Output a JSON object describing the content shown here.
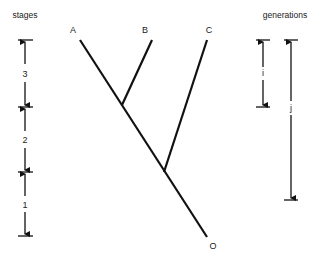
{
  "figure": {
    "type": "phylogenetic tree with time-scale bars",
    "left_scale": {
      "title": "stages",
      "stages": [
        {
          "label": "3",
          "top_y": 40,
          "bottom_y": 107
        },
        {
          "label": "2",
          "top_y": 107,
          "bottom_y": 172
        },
        {
          "label": "1",
          "top_y": 172,
          "bottom_y": 236
        }
      ]
    },
    "right_scale": {
      "title": "generations",
      "bars": [
        {
          "label": "i",
          "x": 263,
          "top_y": 40,
          "bottom_y": 107
        },
        {
          "label": "j",
          "x": 291,
          "top_y": 40,
          "bottom_y": 200
        }
      ]
    },
    "tree": {
      "tips": [
        {
          "label": "A",
          "x": 80,
          "y": 40
        },
        {
          "label": "B",
          "x": 152,
          "y": 40
        },
        {
          "label": "C",
          "x": 207,
          "y": 40
        }
      ],
      "root": {
        "label": "O",
        "x": 207,
        "y": 237
      },
      "internal_nodes": [
        {
          "joins": [
            "A",
            "B"
          ],
          "x": 122,
          "y": 105
        },
        {
          "joins": [
            "AB",
            "C"
          ],
          "x": 164,
          "y": 172
        }
      ]
    }
  }
}
